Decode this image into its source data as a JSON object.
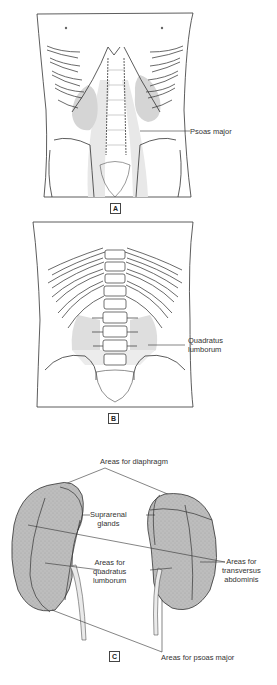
{
  "figure": {
    "panels": [
      {
        "id": "A",
        "tag": "A",
        "view": "anterior abdomen",
        "labels": [
          {
            "text": "Psoas major"
          }
        ]
      },
      {
        "id": "B",
        "tag": "B",
        "view": "posterior abdomen",
        "labels": [
          {
            "text_lines": [
              "Quadratus",
              "lumborum"
            ]
          }
        ]
      },
      {
        "id": "C",
        "tag": "C",
        "view": "kidneys posterior surface",
        "labels": {
          "diaphragm": "Areas for diaphragm",
          "suprarenal": [
            "Suprarenal",
            "glands"
          ],
          "quadratus": [
            "Areas for",
            "quadratus",
            "lumborum"
          ],
          "transversus": [
            "Areas for",
            "transversus",
            "abdominis"
          ],
          "psoas": "Areas for psoas major"
        }
      }
    ],
    "colors": {
      "line": "#333333",
      "shade": "#d9d9d9",
      "kidney": "#b8b8b8",
      "ureter": "#e6e6e6"
    }
  }
}
